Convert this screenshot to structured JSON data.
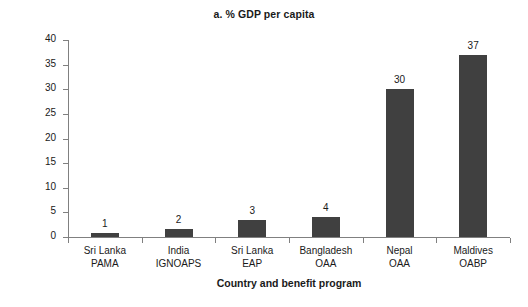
{
  "chart_data": {
    "type": "bar",
    "title": "a. % GDP per capita",
    "xlabel": "Country and benefit program",
    "ylabel": "Benefit amount, % of GDP per capita",
    "categories": [
      "Sri Lanka\nPAMA",
      "India\nIGNOAPS",
      "Sri Lanka\nEAP",
      "Bangladesh\nOAA",
      "Nepal\nOAA",
      "Maldives\nOABP"
    ],
    "category_lines": [
      [
        "Sri Lanka",
        "PAMA"
      ],
      [
        "India",
        "IGNOAPS"
      ],
      [
        "Sri Lanka",
        "EAP"
      ],
      [
        "Bangladesh",
        "OAA"
      ],
      [
        "Nepal",
        "OAA"
      ],
      [
        "Maldives",
        "OABP"
      ]
    ],
    "values": [
      1,
      2,
      3,
      4,
      30,
      37
    ],
    "plotted_values": [
      0.9,
      1.7,
      3.5,
      4.0,
      30,
      37
    ],
    "data_labels": [
      "1",
      "2",
      "3",
      "4",
      "30",
      "37"
    ],
    "ylim": [
      0,
      40
    ],
    "yticks": [
      0,
      5,
      10,
      15,
      20,
      25,
      30,
      35,
      40
    ],
    "ytick_labels": [
      "0",
      "5",
      "10",
      "15",
      "20",
      "25",
      "30",
      "35",
      "40"
    ],
    "grid": false,
    "legend": null,
    "bar_color": "#404040",
    "axis_color": "#808080",
    "text_color": "#1a1a1a",
    "background": "#ffffff"
  }
}
